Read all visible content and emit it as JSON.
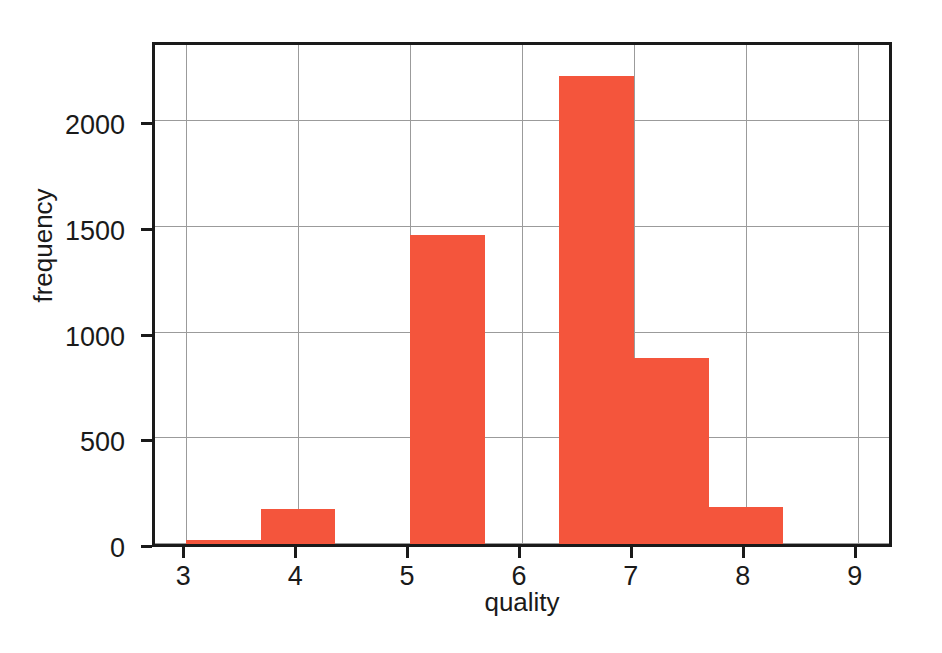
{
  "chart_data": {
    "type": "bar",
    "title": "",
    "subtitle": "",
    "xlabel": "quality",
    "ylabel": "frequency",
    "xlim": [
      2.72,
      9.28
    ],
    "ylim": [
      0,
      2360
    ],
    "grid": true,
    "legend": null,
    "bar_color": "#F4553C",
    "histogram": true,
    "bin_width": 0.667,
    "bin_edges": [
      3.0,
      3.667,
      4.333,
      5.0,
      5.667,
      6.333,
      7.0,
      7.667,
      8.333,
      9.0
    ],
    "bins": [
      {
        "left": 3.0,
        "right": 3.667,
        "value": 20
      },
      {
        "left": 3.667,
        "right": 4.333,
        "value": 165
      },
      {
        "left": 4.333,
        "right": 5.0,
        "value": 0
      },
      {
        "left": 5.0,
        "right": 5.667,
        "value": 1460
      },
      {
        "left": 5.667,
        "right": 6.333,
        "value": 0
      },
      {
        "left": 6.333,
        "right": 7.0,
        "value": 2215
      },
      {
        "left": 7.0,
        "right": 7.667,
        "value": 880
      },
      {
        "left": 7.667,
        "right": 8.333,
        "value": 175
      },
      {
        "left": 8.333,
        "right": 9.0,
        "value": 0
      }
    ],
    "categories": [
      "3.0-3.67",
      "3.67-4.33",
      "4.33-5.0",
      "5.0-5.67",
      "5.67-6.33",
      "6.33-7.0",
      "7.0-7.67",
      "7.67-8.33",
      "8.33-9.0"
    ],
    "values": [
      20,
      165,
      0,
      1460,
      0,
      2215,
      880,
      175,
      0
    ],
    "xticks": [
      {
        "value": 3,
        "label": "3"
      },
      {
        "value": 4,
        "label": "4"
      },
      {
        "value": 5,
        "label": "5"
      },
      {
        "value": 6,
        "label": "6"
      },
      {
        "value": 7,
        "label": "7"
      },
      {
        "value": 8,
        "label": "8"
      },
      {
        "value": 9,
        "label": "9"
      }
    ],
    "yticks": [
      {
        "value": 0,
        "label": "0"
      },
      {
        "value": 500,
        "label": "500"
      },
      {
        "value": 1000,
        "label": "1000"
      },
      {
        "value": 1500,
        "label": "1500"
      },
      {
        "value": 2000,
        "label": "2000"
      }
    ]
  }
}
